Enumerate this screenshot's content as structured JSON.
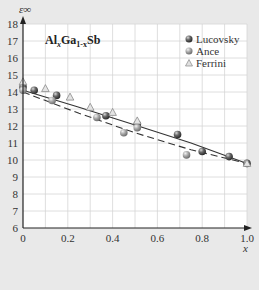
{
  "chart_data": {
    "type": "scatter",
    "title": "AlxGa1-xSb",
    "title_parts": {
      "a": "Al",
      "b": "x",
      "c": "Ga",
      "d": "1-x",
      "e": "Sb"
    },
    "xlabel": "x",
    "ylabel": "ε∞",
    "xlim": [
      0,
      1.0
    ],
    "ylim": [
      6,
      18
    ],
    "xticks": [
      "0",
      "0.2",
      "0.4",
      "0.6",
      "0.8",
      "1.0"
    ],
    "yticks": [
      "6",
      "7",
      "8",
      "9",
      "10",
      "11",
      "12",
      "13",
      "14",
      "15",
      "16",
      "17",
      "18"
    ],
    "grid": true,
    "legend_position": "upper right",
    "series": [
      {
        "name": "Lucovsky",
        "marker": "sphere-dark",
        "color": "#555555",
        "x": [
          0.0,
          0.05,
          0.15,
          0.37,
          0.51,
          0.69,
          0.8,
          0.92,
          1.0
        ],
        "y": [
          14.3,
          14.1,
          13.8,
          12.6,
          12.1,
          11.5,
          10.5,
          10.2,
          9.8
        ]
      },
      {
        "name": "Ance",
        "marker": "sphere-light",
        "color": "#9a9a9a",
        "x": [
          0.0,
          0.13,
          0.33,
          0.45,
          0.51,
          0.73
        ],
        "y": [
          14.1,
          13.5,
          12.5,
          11.6,
          11.9,
          10.3
        ]
      },
      {
        "name": "Ferrini",
        "marker": "triangle",
        "color": "#cccccc",
        "x": [
          0.0,
          0.1,
          0.21,
          0.3,
          0.4,
          0.51,
          1.0
        ],
        "y": [
          14.6,
          14.2,
          13.7,
          13.1,
          12.8,
          12.3,
          9.8
        ]
      }
    ],
    "lines": [
      {
        "name": "fit-solid",
        "style": "solid",
        "x": [
          0,
          0.25,
          0.5,
          0.75,
          1.0
        ],
        "y": [
          14.1,
          13.1,
          12.05,
          11.0,
          9.8
        ]
      },
      {
        "name": "fit-dashed",
        "style": "dashed",
        "x": [
          0,
          0.25,
          0.5,
          0.75,
          1.0
        ],
        "y": [
          14.0,
          12.75,
          11.6,
          10.6,
          9.8
        ]
      }
    ]
  },
  "legend": {
    "items": [
      {
        "label": "Lucovsky"
      },
      {
        "label": "Ance"
      },
      {
        "label": "Ferrini"
      }
    ]
  }
}
